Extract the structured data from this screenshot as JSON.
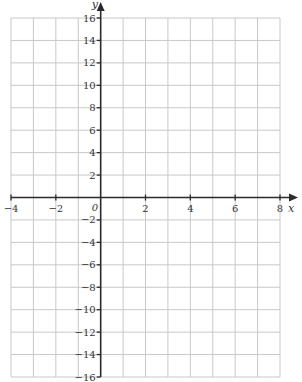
{
  "chart_data": {
    "type": "scatter",
    "title": "",
    "xlabel": "x",
    "ylabel": "y",
    "origin_label": "0",
    "xlim": [
      -4,
      8
    ],
    "ylim": [
      -16,
      16
    ],
    "x_ticks": [
      -4,
      -2,
      2,
      4,
      6,
      8
    ],
    "x_tick_labels": [
      "−4",
      "−2",
      "2",
      "4",
      "6",
      "8"
    ],
    "y_ticks": [
      16,
      14,
      12,
      10,
      8,
      6,
      4,
      2,
      -2,
      -4,
      -6,
      -8,
      -10,
      -12,
      -14,
      -16
    ],
    "y_tick_labels": [
      "16",
      "14",
      "12",
      "10",
      "8",
      "6",
      "4",
      "2",
      "−2",
      "−4",
      "−6",
      "−8",
      "−10",
      "−12",
      "−14",
      "−16"
    ],
    "x_grid_step": 1,
    "y_grid_step": 2,
    "grid": true,
    "legend": null,
    "series": []
  },
  "style": {
    "grid_color": "#c8c8c8",
    "axis_color": "#2b2b2b",
    "text_color": "#333333",
    "background": "#ffffff"
  },
  "layout": {
    "plot_left_px": 11,
    "plot_right_px": 280,
    "plot_top_px": 18,
    "plot_bottom_px": 377,
    "x_axis_arrow_end_px": 298,
    "y_axis_arrow_end_px": 2
  }
}
